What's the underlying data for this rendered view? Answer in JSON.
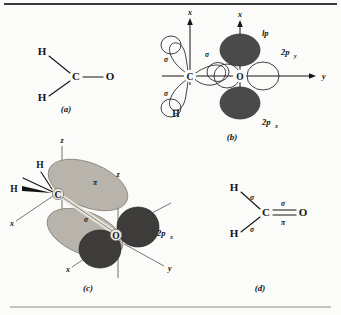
{
  "figure": {
    "background_color": "#fbfbf9",
    "ink_color": "#141414",
    "dark_lobe_color": "#4a4a4a",
    "light_lobe_color": "#b9b4ab",
    "axis_color": "#6e6e6e"
  },
  "panels": [
    {
      "id": "a",
      "label": "(a)",
      "caption_x": 66,
      "caption_y": 112,
      "atoms": [
        "H",
        "C",
        "O",
        "H"
      ],
      "atom_labels": {
        "h_top": "H",
        "carbon": "C",
        "oxygen": "O",
        "h_bottom": "H"
      }
    },
    {
      "id": "b",
      "label": "(b)",
      "caption_x": 232,
      "caption_y": 140,
      "atom_labels": {
        "carbon": "C",
        "oxygen": "O"
      },
      "axis_labels": {
        "x_top": "x",
        "x_top_right": "x",
        "y_right": "y"
      },
      "orbital_labels": {
        "sigma_upper_left": "σ",
        "sigma_lower_left": "σ",
        "sigma_middle": "σ",
        "lone_pair": "lp",
        "two_p_y": "2p",
        "two_p_y_sub": "y",
        "two_p_x": "2p",
        "two_p_x_sub": "x"
      },
      "h_label": "H"
    },
    {
      "id": "c",
      "label": "(c)",
      "caption_x": 88,
      "caption_y": 291,
      "atom_labels": {
        "carbon": "C",
        "oxygen": "O",
        "h_upper": "H",
        "h_wedge": "H"
      },
      "axis_labels": {
        "z_carbon": "z",
        "z_oxygen": "z",
        "x_left": "x",
        "x_bottom": "x",
        "y_right": "y"
      },
      "orbital_labels": {
        "pi": "π",
        "sigma": "σ",
        "two_p_x": "2p",
        "two_p_x_sub": "x"
      }
    },
    {
      "id": "d",
      "label": "(d)",
      "caption_x": 260,
      "caption_y": 291,
      "atom_labels": {
        "h_top": "H",
        "carbon": "C",
        "oxygen": "O",
        "h_bottom": "H"
      },
      "bond_labels": {
        "sigma_h_top": "σ",
        "sigma_h_bottom": "σ",
        "sigma_co": "σ",
        "pi_co": "π"
      }
    }
  ]
}
